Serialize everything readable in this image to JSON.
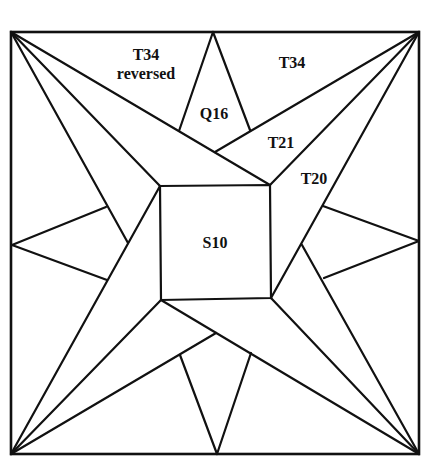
{
  "diagram": {
    "title": "",
    "frame": {
      "x1": 11,
      "y1": 32,
      "x2": 419,
      "y2": 454
    },
    "center_square": {
      "label": "S10",
      "points": [
        [
          160,
          186
        ],
        [
          270,
          185
        ],
        [
          271,
          298
        ],
        [
          161,
          300
        ]
      ]
    },
    "labels": [
      {
        "id": "t34-reversed-top",
        "text": "T34",
        "x": 146,
        "y": 56
      },
      {
        "id": "t34-reversed-bottom",
        "text": "reversed",
        "x": 146,
        "y": 75
      },
      {
        "id": "t34",
        "text": "T34",
        "x": 292,
        "y": 64
      },
      {
        "id": "q16",
        "text": "Q16",
        "x": 214,
        "y": 115
      },
      {
        "id": "t21",
        "text": "T21",
        "x": 281,
        "y": 144
      },
      {
        "id": "t20",
        "text": "T20",
        "x": 314,
        "y": 180
      },
      {
        "id": "s10",
        "text": "S10",
        "x": 215,
        "y": 244
      }
    ],
    "segments": [
      {
        "id": "tl-long",
        "x1": 11,
        "y1": 32,
        "x2": 270,
        "y2": 185
      },
      {
        "id": "tl-diag",
        "x1": 11,
        "y1": 32,
        "x2": 160,
        "y2": 186
      },
      {
        "id": "tl-short",
        "x1": 11,
        "y1": 32,
        "x2": 128,
        "y2": 243
      },
      {
        "id": "tr-long",
        "x1": 419,
        "y1": 32,
        "x2": 271,
        "y2": 298
      },
      {
        "id": "tr-diag",
        "x1": 419,
        "y1": 32,
        "x2": 270,
        "y2": 185
      },
      {
        "id": "tr-short",
        "x1": 419,
        "y1": 32,
        "x2": 215,
        "y2": 152
      },
      {
        "id": "br-long",
        "x1": 419,
        "y1": 454,
        "x2": 161,
        "y2": 300
      },
      {
        "id": "br-diag",
        "x1": 419,
        "y1": 454,
        "x2": 271,
        "y2": 298
      },
      {
        "id": "br-short",
        "x1": 419,
        "y1": 454,
        "x2": 302,
        "y2": 245
      },
      {
        "id": "bl-long",
        "x1": 11,
        "y1": 454,
        "x2": 160,
        "y2": 186
      },
      {
        "id": "bl-diag",
        "x1": 11,
        "y1": 454,
        "x2": 161,
        "y2": 300
      },
      {
        "id": "bl-short",
        "x1": 11,
        "y1": 454,
        "x2": 216,
        "y2": 333
      },
      {
        "id": "top-kite-left",
        "x1": 213,
        "y1": 32,
        "x2": 179,
        "y2": 131
      },
      {
        "id": "top-kite-right",
        "x1": 213,
        "y1": 32,
        "x2": 250,
        "y2": 130
      },
      {
        "id": "right-kite-top",
        "x1": 419,
        "y1": 241,
        "x2": 323,
        "y2": 206
      },
      {
        "id": "right-kite-bottom",
        "x1": 419,
        "y1": 241,
        "x2": 324,
        "y2": 278
      },
      {
        "id": "bottom-kite-left",
        "x1": 217,
        "y1": 454,
        "x2": 180,
        "y2": 355
      },
      {
        "id": "bottom-kite-right",
        "x1": 217,
        "y1": 454,
        "x2": 251,
        "y2": 353
      },
      {
        "id": "left-kite-top",
        "x1": 12,
        "y1": 245,
        "x2": 106,
        "y2": 207
      },
      {
        "id": "left-kite-bottom",
        "x1": 12,
        "y1": 245,
        "x2": 107,
        "y2": 280
      }
    ]
  }
}
